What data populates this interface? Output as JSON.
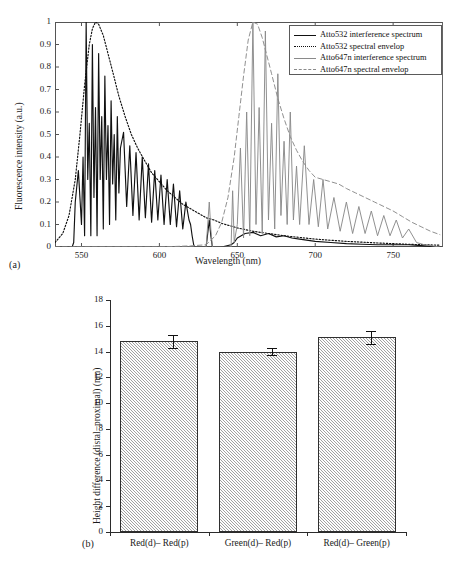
{
  "figure": {
    "panel_a_tag": "(a)",
    "panel_b_tag": "(b)"
  },
  "chart_data": [
    {
      "type": "line",
      "panel": "(a)",
      "title": "",
      "xlabel": "Wavelength (nm)",
      "ylabel": "Fluorescence intensity (a.u.)",
      "xlim": [
        533,
        782
      ],
      "ylim": [
        0,
        1
      ],
      "xticks": [
        550,
        600,
        650,
        700,
        750
      ],
      "yticks": [
        0,
        0.1,
        0.2,
        0.3,
        0.4,
        0.5,
        0.6,
        0.7,
        0.8,
        0.9,
        1
      ],
      "ytick_labels": [
        "0",
        "0.1",
        "0.2",
        "0.3",
        "0.4",
        "0.5",
        "0.6",
        "0.7",
        "0.8",
        "0.9",
        "1"
      ],
      "grid": false,
      "legend_position": "top-right",
      "series": [
        {
          "name": "Atto532 interference spectrum",
          "style": "solid",
          "color": "#111111",
          "x": [
            533,
            540,
            544,
            545,
            546,
            548,
            550,
            551,
            552,
            553,
            554,
            555,
            556,
            557,
            558,
            559,
            560,
            561,
            562,
            563,
            564,
            565,
            566,
            567,
            568,
            569,
            570,
            571,
            572,
            573,
            574,
            575,
            577,
            579,
            581,
            583,
            585,
            587,
            589,
            591,
            593,
            595,
            597,
            599,
            601,
            603,
            605,
            607,
            609,
            611,
            613,
            615,
            617,
            619,
            620,
            621,
            622,
            623,
            630,
            632,
            633,
            634,
            640,
            646,
            648,
            650,
            655,
            660,
            665,
            670,
            675,
            680,
            685,
            690,
            700,
            710,
            720,
            730,
            740,
            750,
            760,
            770,
            780
          ],
          "y": [
            0.0,
            0.0,
            0.0,
            0.02,
            0.2,
            0.34,
            0.1,
            0.4,
            0.05,
            1.0,
            0.3,
            0.55,
            0.05,
            0.9,
            0.22,
            0.62,
            0.05,
            0.86,
            0.3,
            0.58,
            0.08,
            0.76,
            0.3,
            0.54,
            0.1,
            0.65,
            0.28,
            0.5,
            0.12,
            0.58,
            0.24,
            0.44,
            0.51,
            0.18,
            0.45,
            0.14,
            0.42,
            0.12,
            0.4,
            0.13,
            0.37,
            0.11,
            0.34,
            0.12,
            0.32,
            0.1,
            0.3,
            0.1,
            0.28,
            0.09,
            0.25,
            0.08,
            0.2,
            0.12,
            0.1,
            0.05,
            0.01,
            0.0,
            0.0,
            0.12,
            0.05,
            0.0,
            0.0,
            0.01,
            0.02,
            0.04,
            0.06,
            0.065,
            0.05,
            0.06,
            0.045,
            0.05,
            0.04,
            0.035,
            0.025,
            0.02,
            0.015,
            0.012,
            0.01,
            0.01,
            0.01,
            0.005,
            0.0
          ]
        },
        {
          "name": "Atto532 spectral envelop",
          "style": "dotted",
          "color": "#111111",
          "x": [
            533,
            538,
            542,
            546,
            549,
            552,
            555,
            557,
            559,
            561,
            564,
            567,
            570,
            574,
            578,
            582,
            586,
            590,
            595,
            600,
            605,
            610,
            615,
            620,
            625,
            630,
            635,
            640,
            650,
            660,
            670,
            680,
            700,
            720,
            740,
            760,
            780
          ],
          "y": [
            0.02,
            0.06,
            0.14,
            0.3,
            0.5,
            0.72,
            0.9,
            0.97,
            1.0,
            0.99,
            0.94,
            0.86,
            0.78,
            0.67,
            0.58,
            0.5,
            0.44,
            0.39,
            0.33,
            0.29,
            0.25,
            0.22,
            0.19,
            0.17,
            0.15,
            0.13,
            0.12,
            0.105,
            0.085,
            0.07,
            0.06,
            0.05,
            0.035,
            0.025,
            0.018,
            0.012,
            0.008
          ]
        },
        {
          "name": "Atto647n interference spectrum",
          "style": "solid",
          "color": "#8a8a8a",
          "x": [
            533,
            600,
            630,
            632,
            633,
            634,
            640,
            646,
            647,
            648,
            650,
            652,
            654,
            656,
            658,
            660,
            662,
            664,
            666,
            668,
            670,
            672,
            674,
            676,
            678,
            680,
            682,
            684,
            686,
            688,
            690,
            693,
            696,
            699,
            702,
            705,
            708,
            712,
            716,
            720,
            724,
            728,
            732,
            736,
            740,
            744,
            748,
            752,
            756,
            760,
            765,
            770,
            780
          ],
          "y": [
            0.0,
            0.0,
            0.0,
            0.2,
            0.08,
            0.0,
            0.0,
            0.0,
            0.25,
            0.02,
            0.1,
            0.44,
            0.04,
            0.6,
            0.05,
            1.0,
            0.1,
            0.62,
            0.06,
            0.96,
            0.12,
            0.55,
            0.08,
            0.77,
            0.14,
            0.47,
            0.1,
            0.6,
            0.12,
            0.36,
            0.1,
            0.45,
            0.1,
            0.3,
            0.09,
            0.3,
            0.08,
            0.22,
            0.07,
            0.2,
            0.06,
            0.18,
            0.06,
            0.16,
            0.05,
            0.14,
            0.05,
            0.12,
            0.04,
            0.08,
            0.02,
            0.01,
            0.0
          ]
        },
        {
          "name": "Atto647n spectral envelop",
          "style": "dashed",
          "color": "#8a8a8a",
          "x": [
            533,
            600,
            620,
            630,
            636,
            640,
            644,
            648,
            651,
            654,
            657,
            660,
            663,
            666,
            669,
            672,
            676,
            680,
            684,
            688,
            692,
            696,
            700,
            705,
            710,
            715,
            720,
            726,
            732,
            738,
            744,
            750,
            756,
            762,
            768,
            774,
            780
          ],
          "y": [
            0.0,
            0.0,
            0.005,
            0.01,
            0.05,
            0.11,
            0.22,
            0.4,
            0.58,
            0.76,
            0.92,
            1.0,
            0.99,
            0.93,
            0.85,
            0.77,
            0.66,
            0.57,
            0.49,
            0.43,
            0.38,
            0.34,
            0.31,
            0.3,
            0.29,
            0.28,
            0.26,
            0.24,
            0.22,
            0.2,
            0.18,
            0.16,
            0.135,
            0.11,
            0.09,
            0.07,
            0.055
          ]
        }
      ]
    },
    {
      "type": "bar",
      "panel": "(b)",
      "title": "",
      "xlabel": "",
      "ylabel": "Height difference (distal−proximal) (nm)",
      "categories": [
        "Red(d)– Red(p)",
        "Green(d)– Red(p)",
        "Red(d)– Green(p)"
      ],
      "values": [
        14.8,
        14.0,
        15.1
      ],
      "errors": [
        0.5,
        0.3,
        0.5
      ],
      "ylim": [
        0,
        18
      ],
      "yticks": [
        0,
        2,
        4,
        6,
        8,
        10,
        12,
        14,
        16,
        18
      ],
      "ytick_labels": [
        "0",
        "2",
        "4",
        "6",
        "8",
        "10",
        "12",
        "14",
        "16",
        "18"
      ],
      "grid": false,
      "bar_fill": "#d2d2d2",
      "bar_edge": "#2f2f2f",
      "bar_hatch": "diagonal"
    }
  ]
}
